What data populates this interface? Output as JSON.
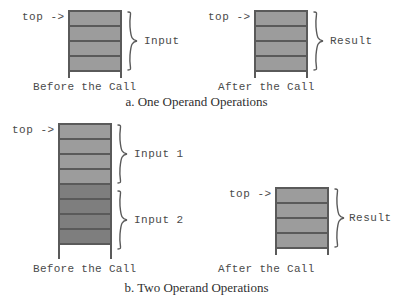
{
  "figure": {
    "title_a": "a. One Operand Operations",
    "title_b": "b. Two Operand Operations"
  },
  "labels": {
    "top_pointer": "top ->",
    "before_call": "Before the Call",
    "after_call": "After the Call",
    "input": "Input",
    "result": "Result",
    "input_1": "Input 1",
    "input_2": "Input 2"
  },
  "colors": {
    "cell_light": "#9c9c9c",
    "cell_dark": "#7e7e7e",
    "outline": "#5a5a5a",
    "text": "#4a4a4a",
    "caption_text": "#2f2f2f",
    "background": "#ffffff"
  },
  "panels": [
    {
      "id": "one-operand-before",
      "caption": "Before the Call",
      "top_pointer": "top ->",
      "cells": 4,
      "shading": [
        "light",
        "light",
        "light",
        "light"
      ],
      "braces": [
        {
          "label": "Input",
          "spans_cells": [
            1,
            4
          ]
        }
      ]
    },
    {
      "id": "one-operand-after",
      "caption": "After the Call",
      "top_pointer": "top ->",
      "cells": 4,
      "shading": [
        "light",
        "light",
        "light",
        "light"
      ],
      "braces": [
        {
          "label": "Result",
          "spans_cells": [
            1,
            4
          ]
        }
      ]
    },
    {
      "id": "two-operand-before",
      "caption": "Before the Call",
      "top_pointer": "top ->",
      "cells": 8,
      "shading": [
        "light",
        "light",
        "light",
        "light",
        "dark",
        "dark",
        "dark",
        "dark"
      ],
      "braces": [
        {
          "label": "Input 1",
          "spans_cells": [
            1,
            4
          ]
        },
        {
          "label": "Input 2",
          "spans_cells": [
            5,
            8
          ]
        }
      ]
    },
    {
      "id": "two-operand-after",
      "caption": "After the Call",
      "top_pointer": "top ->",
      "cells": 4,
      "shading": [
        "light",
        "light",
        "light",
        "light"
      ],
      "braces": [
        {
          "label": "Result",
          "spans_cells": [
            1,
            4
          ]
        }
      ]
    }
  ]
}
